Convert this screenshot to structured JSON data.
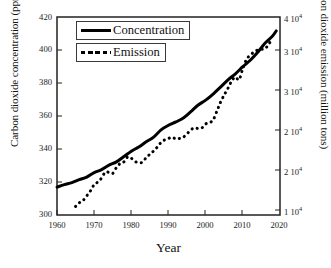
{
  "chart_data": {
    "type": "line",
    "title": "",
    "xlabel": "Year",
    "ylabel": "Carbon dioxide concentration (ppm)",
    "ylabel_right": "Carbon dioxide emission (million tons)",
    "xlim": [
      1960,
      2020
    ],
    "ylim": [
      300,
      420
    ],
    "ylim_right": [
      10000,
      40000
    ],
    "xticks": [
      1960,
      1970,
      1980,
      1990,
      2000,
      2010,
      2020
    ],
    "yticks_left": [
      300,
      320,
      340,
      360,
      380,
      400,
      420
    ],
    "yticks_right": [
      10000,
      15000,
      20000,
      25000,
      30000,
      35000,
      40000
    ],
    "yticklabels_right": [
      "1 10",
      "2 10",
      "2 10",
      "3 10",
      "3 10",
      "4 10"
    ],
    "yticklabel_right_exponent": "4",
    "grid": false,
    "legend_position": "upper-left",
    "series": [
      {
        "name": "Concentration",
        "style": "solid",
        "color": "#000000",
        "axis": "left",
        "units": "ppm",
        "x": [
          1960,
          1962,
          1964,
          1966,
          1968,
          1970,
          1972,
          1974,
          1976,
          1978,
          1980,
          1982,
          1984,
          1986,
          1988,
          1990,
          1992,
          1994,
          1996,
          1998,
          2000,
          2002,
          2004,
          2006,
          2008,
          2010,
          2012,
          2014,
          2016,
          2018,
          2019
        ],
        "y": [
          316.9,
          318.4,
          319.6,
          321.4,
          323.0,
          325.7,
          327.5,
          330.2,
          332.2,
          335.4,
          338.7,
          341.2,
          344.4,
          347.2,
          351.6,
          354.4,
          356.4,
          358.8,
          362.6,
          366.7,
          369.6,
          373.3,
          377.5,
          381.9,
          385.6,
          389.9,
          393.8,
          398.6,
          404.2,
          408.5,
          411.6
        ]
      },
      {
        "name": "Emission",
        "style": "dashed",
        "color": "#000000",
        "axis": "right",
        "units": "million tons",
        "x": [
          1965,
          1966,
          1967,
          1968,
          1969,
          1970,
          1971,
          1972,
          1973,
          1974,
          1975,
          1976,
          1977,
          1978,
          1979,
          1980,
          1981,
          1982,
          1983,
          1984,
          1985,
          1986,
          1987,
          1988,
          1989,
          1990,
          1991,
          1992,
          1993,
          1994,
          1995,
          1996,
          1997,
          1998,
          1999,
          2000,
          2001,
          2002,
          2003,
          2004,
          2005,
          2006,
          2007,
          2008,
          2009,
          2010,
          2011,
          2012,
          2013,
          2014,
          2015,
          2016,
          2017,
          2018
        ],
        "y": [
          11300,
          11850,
          12200,
          12900,
          13650,
          14600,
          15000,
          15600,
          16500,
          16450,
          16300,
          17200,
          17800,
          18050,
          18800,
          18600,
          18100,
          17950,
          18000,
          18700,
          19200,
          19700,
          20300,
          21000,
          21400,
          21600,
          21800,
          21500,
          21600,
          21800,
          22300,
          22900,
          23200,
          23100,
          23200,
          23800,
          24000,
          24400,
          25700,
          27100,
          28200,
          29200,
          30300,
          30900,
          30500,
          32200,
          33600,
          34200,
          34700,
          35000,
          35100,
          35200,
          35900,
          36800
        ]
      }
    ],
    "annotations": []
  },
  "legend": {
    "concentration": "Concentration",
    "emission": "Emission"
  },
  "axis_titles": {
    "left": "Carbon dioxide concentration (ppm)",
    "right": "Carbon dioxide emission (million tons)",
    "bottom": "Year"
  },
  "tick_labels": {
    "left": [
      "420",
      "400",
      "380",
      "360",
      "340",
      "320",
      "300"
    ],
    "right": [
      "4 10",
      "3 10",
      "3 10",
      "2 10",
      "2 10",
      "1 10"
    ],
    "right_exponent": "4",
    "bottom": [
      "1960",
      "1970",
      "1980",
      "1990",
      "2000",
      "2010",
      "2020"
    ]
  },
  "colors": {
    "line": "#000000",
    "frame": "#222222",
    "background": "#ffffff"
  }
}
